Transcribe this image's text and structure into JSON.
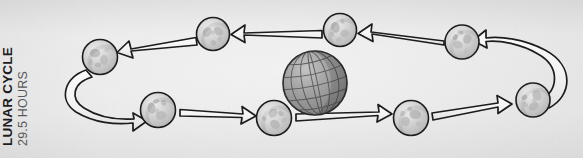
{
  "figure": {
    "width": 583,
    "height": 158,
    "background_color": "#e3e3e3",
    "style": "hand-drawn pencil sketch diagram"
  },
  "caption": {
    "title": "LUNAR CYCLE",
    "subtitle": "29.5 HOURS",
    "title_color": "#1c1c1c",
    "subtitle_color": "#58585a",
    "orientation": "rotated-90-counterclockwise"
  },
  "colors": {
    "ink": "#1a1a1a",
    "moon_fill": "#c9c9c9",
    "moon_highlight": "#e8e8e8",
    "moon_crater": "#a8a8a8",
    "earth_fill": "#9a9a9a",
    "earth_grid": "#5a5a5a",
    "arrow_fill": "#f2f2f2",
    "paper": "#e3e3e3"
  },
  "earth": {
    "label": "earth-globe",
    "cx": 315,
    "cy": 83,
    "r": 32,
    "tilt_deg": -12,
    "meridian_count": 5,
    "parallel_count": 5
  },
  "moons": [
    {
      "id": "moon-1",
      "phase_label": "new-moon",
      "cx": 100,
      "cy": 57,
      "r": 17.5
    },
    {
      "id": "moon-2",
      "phase_label": "waxing-crescent",
      "cx": 213,
      "cy": 34,
      "r": 16.5
    },
    {
      "id": "moon-3",
      "phase_label": "first-quarter",
      "cx": 340,
      "cy": 30,
      "r": 16.5
    },
    {
      "id": "moon-4",
      "phase_label": "waxing-gibbous",
      "cx": 462,
      "cy": 42,
      "r": 17.0
    },
    {
      "id": "moon-5",
      "phase_label": "full-moon",
      "cx": 533,
      "cy": 100,
      "r": 17.0
    },
    {
      "id": "moon-6",
      "phase_label": "waning-gibbous",
      "cx": 411,
      "cy": 118,
      "r": 17.5
    },
    {
      "id": "moon-7",
      "phase_label": "last-quarter",
      "cx": 274,
      "cy": 118,
      "r": 17.5
    },
    {
      "id": "moon-8",
      "phase_label": "waning-crescent",
      "cx": 158,
      "cy": 110,
      "r": 17.5
    }
  ],
  "arrows": [
    {
      "id": "arrow-top-1",
      "from": "moon-3",
      "to": "moon-2",
      "direction": "left"
    },
    {
      "id": "arrow-top-2",
      "from": "moon-4",
      "to": "moon-3",
      "direction": "left"
    },
    {
      "id": "arrow-top-3",
      "from": "moon-2",
      "to": "moon-1",
      "direction": "left"
    },
    {
      "id": "arrow-right",
      "from": "moon-5",
      "to": "moon-4",
      "direction": "curve-up-left"
    },
    {
      "id": "arrow-left",
      "from": "moon-1",
      "to": "moon-8",
      "direction": "curve-down-right"
    },
    {
      "id": "arrow-bottom-1",
      "from": "moon-8",
      "to": "moon-7",
      "direction": "right"
    },
    {
      "id": "arrow-bottom-2",
      "from": "moon-7",
      "to": "moon-6",
      "direction": "right"
    },
    {
      "id": "arrow-bottom-3",
      "from": "moon-6",
      "to": "moon-5",
      "direction": "right"
    }
  ],
  "orbit": {
    "rotation_direction": "counterclockwise",
    "moon_count": 8
  }
}
